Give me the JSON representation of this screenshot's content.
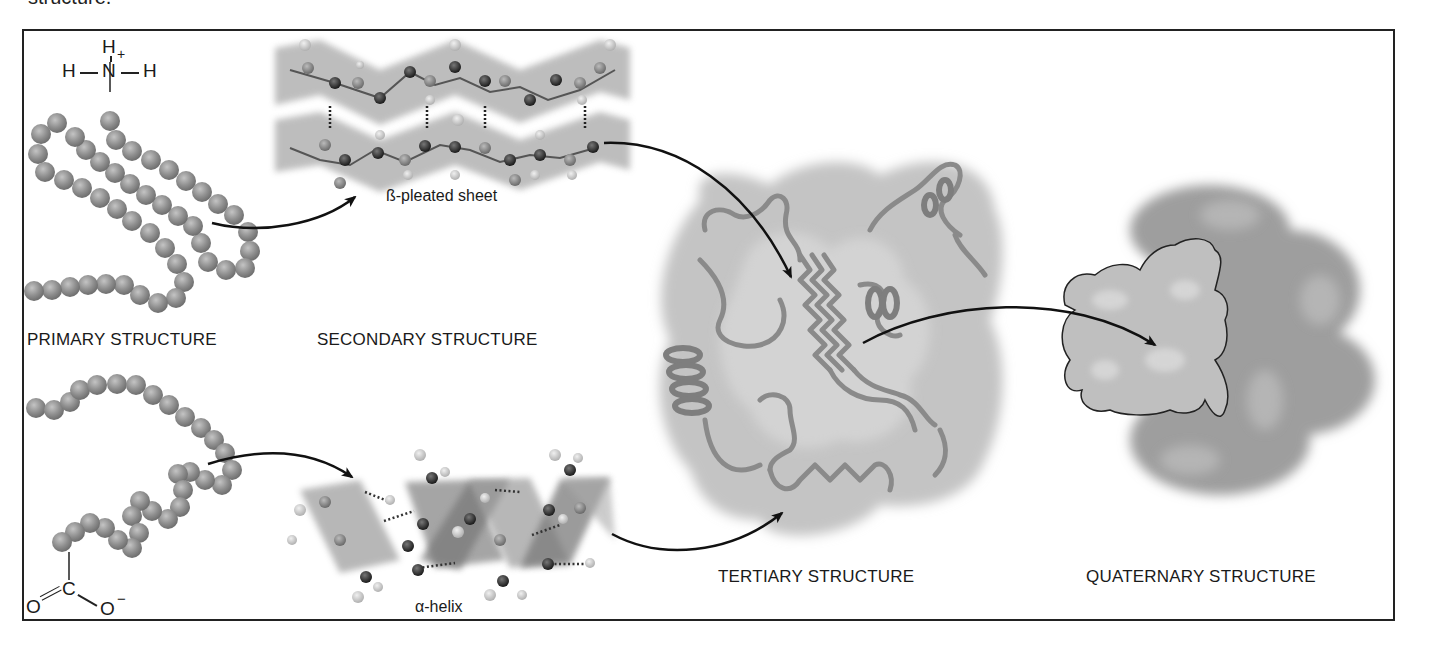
{
  "caption_fragment": "structure.",
  "labels": {
    "primary": "PRIMARY STRUCTURE",
    "secondary": "SECONDARY STRUCTURE",
    "tertiary": "TERTIARY STRUCTURE",
    "quaternary": "QUATERNARY STRUCTURE"
  },
  "sublabels": {
    "beta_sheet": "ß-pleated sheet",
    "alpha_helix": "α-helix"
  },
  "chemistry": {
    "n_terminus": {
      "top_h": "H",
      "left_h": "H",
      "center": "N",
      "charge": "+",
      "right_h": "H"
    },
    "c_terminus": {
      "center": "C",
      "left_o": "O",
      "right_o": "O",
      "charge": "−"
    }
  },
  "colors": {
    "frame": "#222222",
    "bead": "#8c8c8c",
    "ribbon": "#9a9a9a",
    "surface": "#c8c8c8",
    "arrow": "#111111"
  }
}
